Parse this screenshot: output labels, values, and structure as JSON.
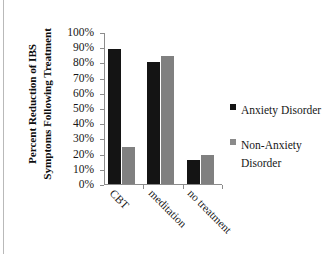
{
  "chart_data": {
    "type": "bar",
    "title": "",
    "subtitle": "",
    "xlabel": "",
    "ylabel": "Percent Reduction of IBS Symptoms Following Treatment",
    "ylabel_line1": "Percent Reduction of IBS",
    "ylabel_line2": "Symptoms Following Treatment",
    "categories": [
      "CBT",
      "meditation",
      "no treatment"
    ],
    "series": [
      {
        "name": "Anxiety Disorder",
        "color": "#141414",
        "values": [
          89,
          80,
          15.5
        ]
      },
      {
        "name": "Non-Anxiety Disorder",
        "color": "#808080",
        "values": [
          24.5,
          84,
          19
        ]
      }
    ],
    "ylim": [
      0,
      100
    ],
    "ytick_labels": [
      "100%",
      "90%",
      "80%",
      "70%",
      "60%",
      "50%",
      "40%",
      "30%",
      "20%",
      "10%",
      "0%"
    ],
    "ytick_values": [
      100,
      90,
      80,
      70,
      60,
      50,
      40,
      30,
      20,
      10,
      0
    ],
    "ytick_suffix": "%",
    "grid": false,
    "legend_position": "right",
    "legend": [
      {
        "label": "Anxiety Disorder",
        "color": "#141414"
      },
      {
        "label": "Non-Anxiety Disorder",
        "color": "#8a8a8a"
      }
    ]
  },
  "legend": {
    "items": [
      {
        "label": "Anxiety Disorder"
      },
      {
        "label_line1": "Non-Anxiety",
        "label_line2": "Disorder"
      }
    ]
  }
}
